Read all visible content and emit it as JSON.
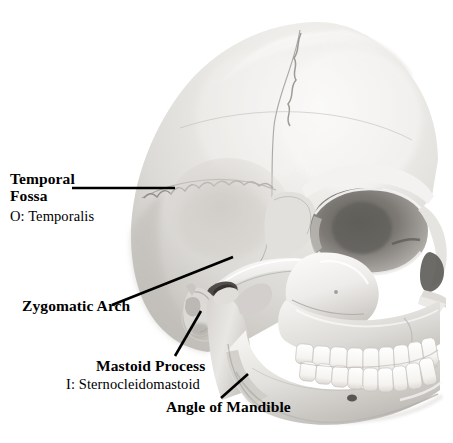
{
  "figure": {
    "background_color": "#ffffff",
    "label_color": "#000000",
    "leader_color": "#000000",
    "width": 453,
    "height": 443
  },
  "labels": {
    "temporal_fossa": {
      "line1": "Temporal",
      "line2": "Fossa",
      "muscle": "O: Temporalis"
    },
    "zygomatic_arch": {
      "name": "Zygomatic Arch"
    },
    "mastoid_process": {
      "name": "Mastoid Process",
      "muscle": "I: Sternocleidomastoid"
    },
    "angle_of_mandible": {
      "name": "Angle of Mandible"
    }
  },
  "image": {
    "subject": "human skull",
    "view": "left lateral oblique",
    "rendering": "grayscale photograph",
    "bone_light": "#f2f1ef",
    "bone_mid": "#d9d7d3",
    "bone_shadow": "#b4b1ac",
    "bone_deep_shadow": "#8d8a85",
    "cavity_dark": "#4a4845",
    "outline": "#9b9894"
  }
}
